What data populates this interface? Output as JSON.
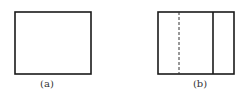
{
  "figures": [
    {
      "id": "a",
      "label": "(a)",
      "description": "plain rectangle"
    },
    {
      "id": "b",
      "label": "(b)",
      "description": "rectangle with dashed vertical line and solid vertical line"
    }
  ],
  "colors": {
    "stroke": "#1a1a1a",
    "label": "#333333",
    "background": "#ffffff"
  }
}
